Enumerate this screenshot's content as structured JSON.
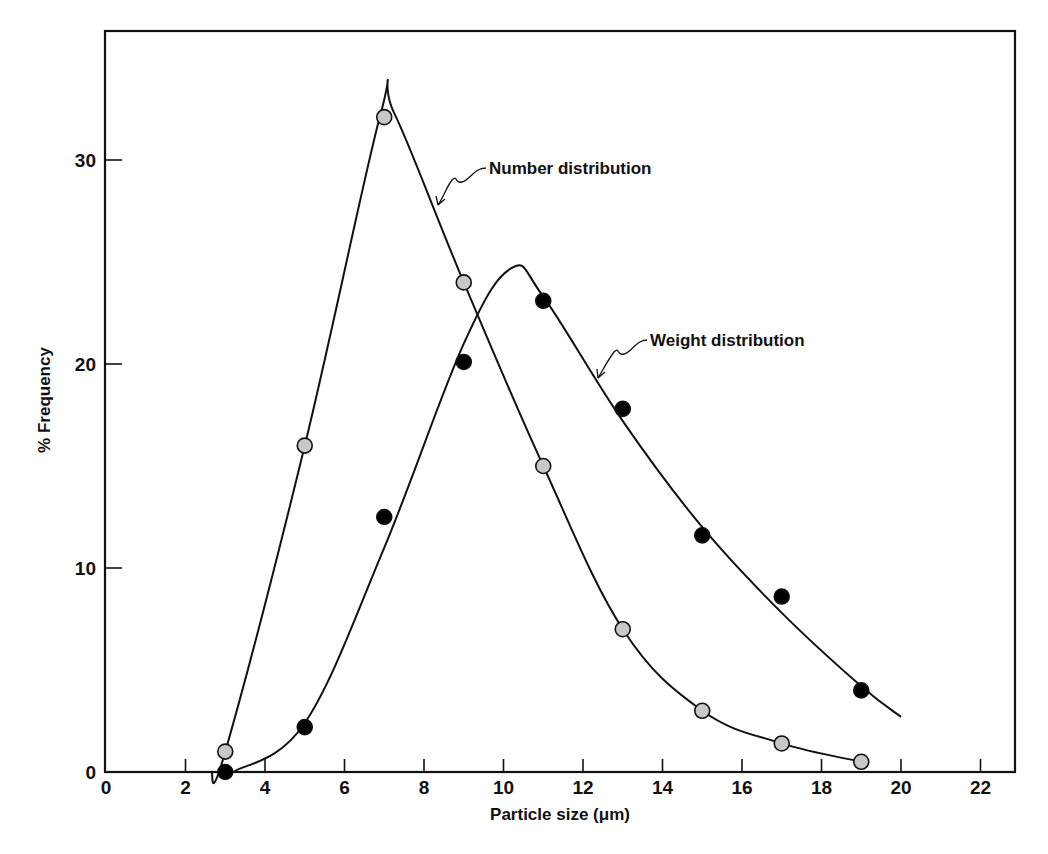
{
  "chart_data": {
    "type": "line",
    "title": "",
    "xlabel": "Particle size (μm)",
    "ylabel": "% Frequency",
    "xlim": [
      0,
      23
    ],
    "ylim": [
      0,
      36
    ],
    "x_ticks": [
      0,
      2,
      4,
      6,
      8,
      10,
      12,
      14,
      16,
      18,
      20,
      22
    ],
    "y_ticks": [
      0,
      10,
      20,
      30
    ],
    "grid": false,
    "legend": "none (curves labeled by annotations)",
    "series": [
      {
        "name": "Number distribution",
        "marker": "gray-filled circle",
        "marker_color": "#c8c8c8",
        "x": [
          3,
          5,
          7,
          9,
          11,
          13,
          15,
          17,
          19
        ],
        "values": [
          1.0,
          16.0,
          32.1,
          24.0,
          15.0,
          7.0,
          3.0,
          1.4,
          0.5
        ],
        "curve": [
          [
            2.65,
            0
          ],
          [
            3,
            1.0
          ],
          [
            5,
            16.0
          ],
          [
            6.9,
            32.2
          ],
          [
            7.25,
            32.3
          ],
          [
            9,
            24.0
          ],
          [
            11,
            15.0
          ],
          [
            13,
            7.0
          ],
          [
            15,
            3.0
          ],
          [
            17,
            1.4
          ],
          [
            19,
            0.5
          ]
        ]
      },
      {
        "name": "Weight distribution",
        "marker": "black-filled circle",
        "marker_color": "#000000",
        "x": [
          3,
          5,
          7,
          9,
          11,
          13,
          15,
          17,
          19
        ],
        "values": [
          0.0,
          2.2,
          12.5,
          20.1,
          23.1,
          17.8,
          11.6,
          8.6,
          4.0
        ],
        "curve": [
          [
            3.2,
            0
          ],
          [
            5,
            2.4
          ],
          [
            7,
            11.0
          ],
          [
            9,
            21.0
          ],
          [
            10.2,
            24.7
          ],
          [
            11,
            23.3
          ],
          [
            13,
            17.2
          ],
          [
            15,
            12.0
          ],
          [
            17,
            7.8
          ],
          [
            19,
            4.2
          ],
          [
            20,
            2.7
          ]
        ]
      }
    ],
    "annotations": [
      {
        "text": "Number distribution",
        "points_to_series": "Number distribution"
      },
      {
        "text": "Weight distribution",
        "points_to_series": "Weight distribution"
      }
    ]
  }
}
